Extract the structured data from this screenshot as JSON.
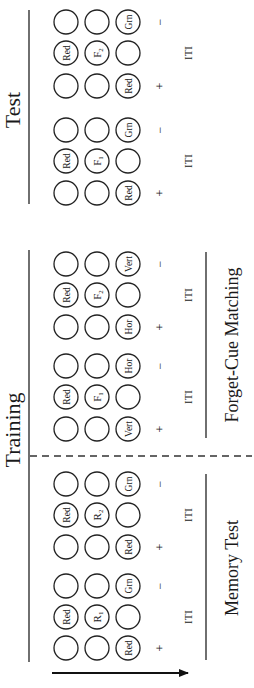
{
  "diagram": {
    "orientation": "rotated-90-ccw",
    "phases": [
      {
        "label": "Test",
        "title_y": 110
      },
      {
        "label": "Training",
        "title_y": 430
      }
    ],
    "subphases": [
      {
        "label": "Forget-Cue Matching",
        "y1": 252,
        "y2": 438
      },
      {
        "label": "Memory Test",
        "y1": 474,
        "y2": 660
      }
    ],
    "iti_label": "ITI",
    "positive_sign": "+",
    "negative_sign": "−",
    "blocks": [
      {
        "section": "test",
        "trials": [
          {
            "id": "test-trial-1",
            "rows": [
              {
                "y": 193,
                "cells": [
                  "",
                  "",
                  "Red"
                ],
                "sign": "+"
              },
              {
                "y": 161,
                "cells": [
                  "Red",
                  "F1",
                  ""
                ],
                "sign": ""
              },
              {
                "y": 130,
                "cells": [
                  "",
                  "",
                  "Grn"
                ],
                "sign": "−"
              }
            ]
          },
          {
            "id": "test-trial-2",
            "rows": [
              {
                "y": 86,
                "cells": [
                  "",
                  "",
                  "Red"
                ],
                "sign": "+"
              },
              {
                "y": 53,
                "cells": [
                  "Red",
                  "F2",
                  ""
                ],
                "sign": ""
              },
              {
                "y": 22,
                "cells": [
                  "",
                  "",
                  "Grn"
                ],
                "sign": "−"
              }
            ]
          }
        ]
      },
      {
        "section": "forget-cue-matching",
        "trials": [
          {
            "id": "fcm-trial-1",
            "rows": [
              {
                "y": 429,
                "cells": [
                  "",
                  "",
                  "Vert"
                ],
                "sign": "+"
              },
              {
                "y": 397,
                "cells": [
                  "Red",
                  "F1",
                  ""
                ],
                "sign": ""
              },
              {
                "y": 366,
                "cells": [
                  "",
                  "",
                  "Hor"
                ],
                "sign": "−"
              }
            ]
          },
          {
            "id": "fcm-trial-2",
            "rows": [
              {
                "y": 327,
                "cells": [
                  "",
                  "",
                  "Hor"
                ],
                "sign": "+"
              },
              {
                "y": 295,
                "cells": [
                  "Red",
                  "F2",
                  ""
                ],
                "sign": ""
              },
              {
                "y": 264,
                "cells": [
                  "",
                  "",
                  "Vert"
                ],
                "sign": "−"
              }
            ]
          }
        ]
      },
      {
        "section": "memory-test",
        "trials": [
          {
            "id": "mt-trial-1",
            "rows": [
              {
                "y": 648,
                "cells": [
                  "",
                  "",
                  "Red"
                ],
                "sign": "+"
              },
              {
                "y": 617,
                "cells": [
                  "Red",
                  "R1",
                  ""
                ],
                "sign": ""
              },
              {
                "y": 586,
                "cells": [
                  "",
                  "",
                  "Grn"
                ],
                "sign": "−"
              }
            ]
          },
          {
            "id": "mt-trial-2",
            "rows": [
              {
                "y": 547,
                "cells": [
                  "",
                  "",
                  "Red"
                ],
                "sign": "+"
              },
              {
                "y": 515,
                "cells": [
                  "Red",
                  "R2",
                  ""
                ],
                "sign": ""
              },
              {
                "y": 484,
                "cells": [
                  "",
                  "",
                  "Grn"
                ],
                "sign": "−"
              }
            ]
          }
        ]
      }
    ],
    "time_arrow": {
      "label": "time-direction"
    }
  }
}
